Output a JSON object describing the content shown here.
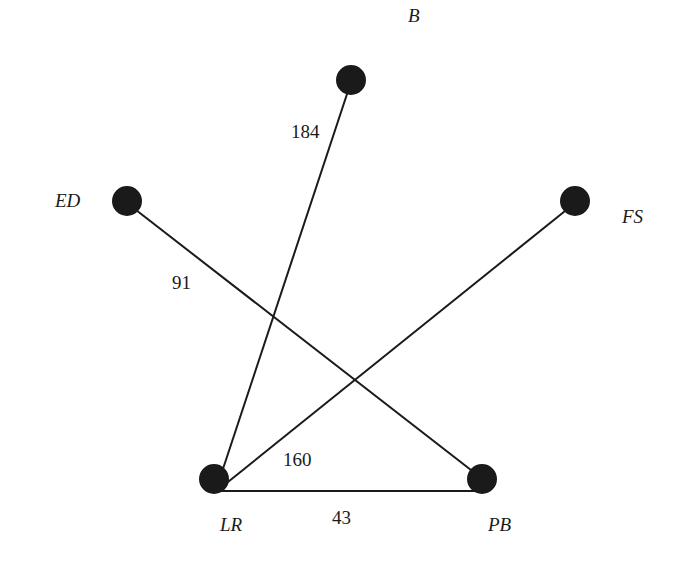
{
  "diagram": {
    "type": "weighted-graph",
    "nodes": [
      {
        "id": "B",
        "label": "B",
        "x": 351,
        "y": 80,
        "label_x": 408,
        "label_y": 22
      },
      {
        "id": "ED",
        "label": "ED",
        "x": 127,
        "y": 201,
        "label_x": 55,
        "label_y": 207
      },
      {
        "id": "FS",
        "label": "FS",
        "x": 575,
        "y": 201,
        "label_x": 622,
        "label_y": 223
      },
      {
        "id": "LR",
        "label": "LR",
        "x": 214,
        "y": 479,
        "label_x": 220,
        "label_y": 531
      },
      {
        "id": "PB",
        "label": "PB",
        "x": 482,
        "y": 479,
        "label_x": 488,
        "label_y": 531
      }
    ],
    "edges": [
      {
        "from": "LR",
        "to": "B",
        "weight": "184",
        "label_x": 291,
        "label_y": 138
      },
      {
        "from": "ED",
        "to": "PB",
        "weight": "91",
        "label_x": 172,
        "label_y": 289
      },
      {
        "from": "LR",
        "to": "FS",
        "weight": "160",
        "label_x": 283,
        "label_y": 466
      },
      {
        "from": "LR",
        "to": "PB",
        "weight": "43",
        "label_x": 332,
        "label_y": 524
      }
    ]
  }
}
